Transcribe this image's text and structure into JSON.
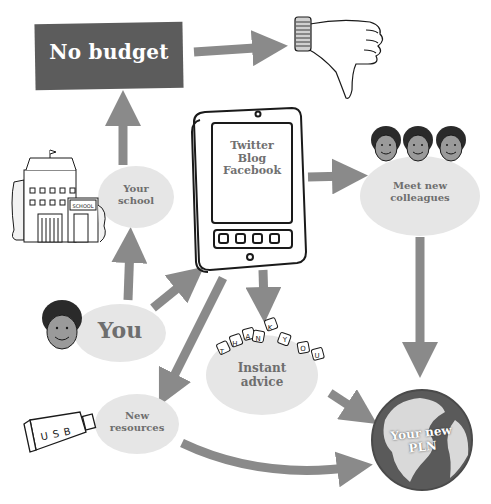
{
  "diagram": {
    "type": "flow-diagram",
    "topic": "Personal Learning Network",
    "nodes": {
      "no_budget": {
        "label": "No budget",
        "icon": "thumbs-down-icon"
      },
      "your_school": {
        "line1": "Your",
        "line2": "school",
        "icon": "school-building-icon",
        "building_sign": "SCHOOL"
      },
      "tablet": {
        "line1": "Twitter",
        "line2": "Blog",
        "line3": "Facebook",
        "icon": "tablet-icon"
      },
      "meet_colleagues": {
        "line1": "Meet new",
        "line2": "colleagues",
        "icon": "three-faces-icon"
      },
      "you": {
        "label": "You",
        "icon": "face-icon"
      },
      "instant_advice": {
        "line1": "Instant",
        "line2": "advice",
        "icon": "thank-you-keys-icon",
        "keys": [
          "T",
          "H",
          "A",
          "N",
          "K",
          "Y",
          "O",
          "U"
        ]
      },
      "new_resources": {
        "line1": "New",
        "line2": "resources",
        "icon": "usb-stick-icon",
        "usb_text": "USB"
      },
      "your_new_pln": {
        "line1": "Your new",
        "line2": "PLN",
        "icon": "globe-icon"
      }
    },
    "edges": [
      {
        "from": "no_budget",
        "to": "thumbs_down"
      },
      {
        "from": "your_school",
        "to": "no_budget"
      },
      {
        "from": "you",
        "to": "your_school"
      },
      {
        "from": "you",
        "to": "tablet"
      },
      {
        "from": "tablet",
        "to": "meet_colleagues"
      },
      {
        "from": "tablet",
        "to": "instant_advice"
      },
      {
        "from": "tablet",
        "to": "new_resources"
      },
      {
        "from": "meet_colleagues",
        "to": "your_new_pln"
      },
      {
        "from": "instant_advice",
        "to": "your_new_pln"
      },
      {
        "from": "new_resources",
        "to": "your_new_pln"
      }
    ],
    "colors": {
      "arrow": "#8a8a8a",
      "bubble": "#e6e6e6",
      "label_text": "#6e6e6e",
      "budget_box": "#5c5c5c",
      "globe_dark": "#5a5a5a",
      "globe_light": "#d9d9d9",
      "ink": "#1a1a1a"
    }
  }
}
